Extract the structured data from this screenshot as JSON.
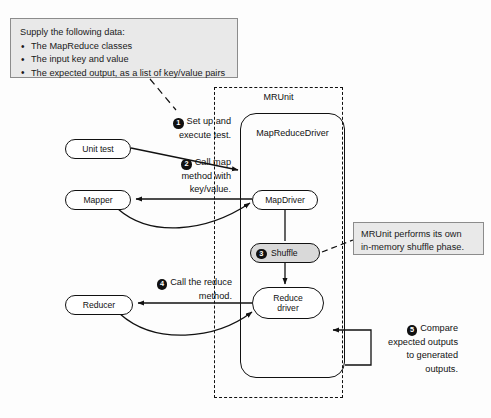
{
  "diagram": {
    "colors": {
      "note_fill": "#e9e9e9",
      "note_border": "#8c8c8c",
      "stroke": "#111111",
      "shuffle_fill": "#d9d9d9",
      "background": "#fdfdfd"
    },
    "supply_note": {
      "title": "Supply the following data:",
      "bullets": [
        "The MapReduce classes",
        "The input key and value",
        "The expected output, as a list of key/value pairs"
      ]
    },
    "shuffle_note": {
      "line1": "MRUnit performs its own",
      "line2": "in-memory shuffle phase."
    },
    "containers": {
      "mrunit_label": "MRUnit",
      "mapreducedriver_label": "MapReduceDriver"
    },
    "nodes": {
      "unit_test": "Unit test",
      "mapper": "Mapper",
      "reducer": "Reducer",
      "map_driver": "MapDriver",
      "shuffle": "Shuffle",
      "reduce_driver_line1": "Reduce",
      "reduce_driver_line2": "driver"
    },
    "steps": [
      {
        "number": "1",
        "line1": "Set up and",
        "line2": "execute test.",
        "line3": "",
        "line4": ""
      },
      {
        "number": "2",
        "line1": "Call map",
        "line2": "method with",
        "line3": "key/value.",
        "line4": ""
      },
      {
        "number": "3",
        "line1": "Shuffle",
        "line2": "",
        "line3": "",
        "line4": ""
      },
      {
        "number": "4",
        "line1": "Call the reduce",
        "line2": "method.",
        "line3": "",
        "line4": ""
      },
      {
        "number": "5",
        "line1": "Compare",
        "line2": "expected outputs",
        "line3": "to generated",
        "line4": "outputs."
      }
    ]
  }
}
